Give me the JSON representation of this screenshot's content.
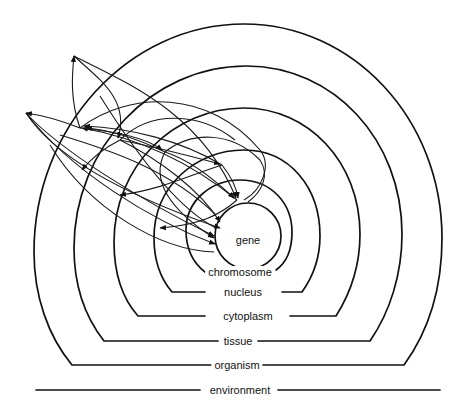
{
  "diagram": {
    "levels": [
      {
        "id": "gene",
        "label": "gene"
      },
      {
        "id": "chromosome",
        "label": "chromosome"
      },
      {
        "id": "nucleus",
        "label": "nucleus"
      },
      {
        "id": "cytoplasm",
        "label": "cytoplasm"
      },
      {
        "id": "tissue",
        "label": "tissue"
      },
      {
        "id": "organism",
        "label": "organism"
      },
      {
        "id": "environment",
        "label": "environment"
      }
    ],
    "colors": {
      "line": "#111111",
      "background": "#ffffff"
    }
  }
}
